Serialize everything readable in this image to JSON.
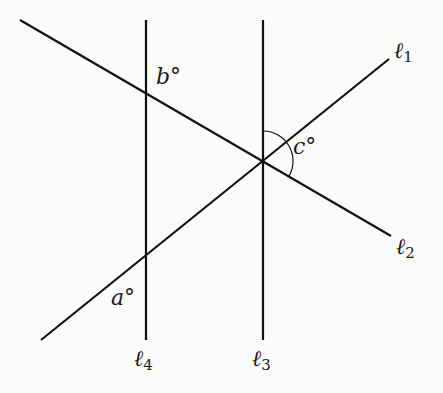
{
  "diagram": {
    "type": "geometry-lines-angles",
    "lines": [
      {
        "id": "l1",
        "label": "ℓ",
        "sub": "1",
        "from": [
          41,
          340
        ],
        "to": [
          389,
          59
        ]
      },
      {
        "id": "l2",
        "label": "ℓ",
        "sub": "2",
        "from": [
          20,
          20
        ],
        "to": [
          391,
          236
        ]
      },
      {
        "id": "l3",
        "label": "ℓ",
        "sub": "3",
        "from": [
          263,
          20
        ],
        "to": [
          263,
          340
        ]
      },
      {
        "id": "l4",
        "label": "ℓ",
        "sub": "4",
        "from": [
          146,
          20
        ],
        "to": [
          146,
          340
        ]
      }
    ],
    "angles": [
      {
        "id": "a",
        "label": "a°"
      },
      {
        "id": "b",
        "label": "b°"
      },
      {
        "id": "c",
        "label": "c°"
      }
    ],
    "stroke_color": "#111111"
  }
}
